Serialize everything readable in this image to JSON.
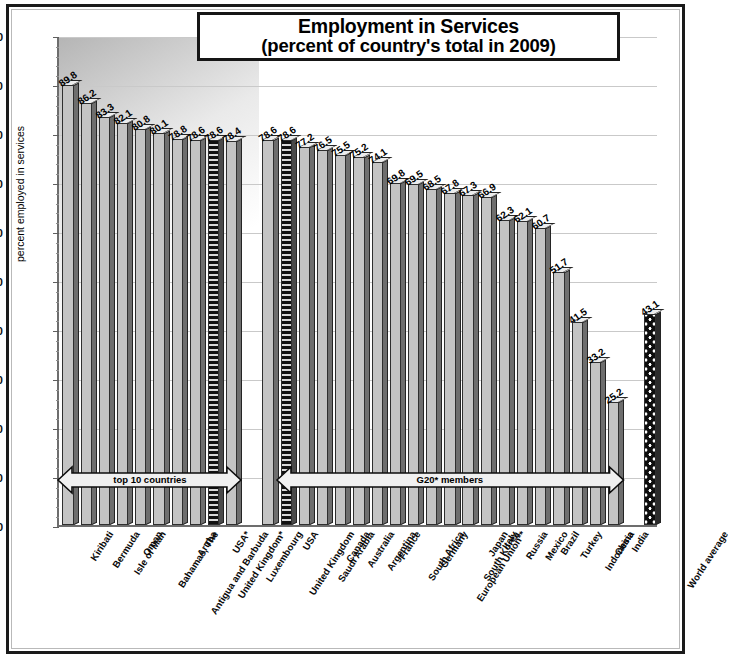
{
  "chart_data": {
    "type": "bar",
    "title": "Employment in Services (percent of country's total in 2009)",
    "title_line1": "Employment in Services",
    "title_line2": "(percent of country's total in 2009)",
    "xlabel": "",
    "ylabel": "percent employed in services",
    "ylim": [
      0,
      100
    ],
    "ytick_step": 10,
    "yticks": [
      "0",
      "10",
      "20",
      "30",
      "40",
      "50",
      "60",
      "70",
      "80",
      "90",
      "100"
    ],
    "grid": true,
    "legend_position": "none",
    "categories": [
      "Kiribati",
      "Bermuda",
      "Isle of Man",
      "Oman",
      "Bahamas, The",
      "Antigua and Barbuda",
      "Aruba",
      "United Kingdom*",
      "USA*",
      "Luxembourg",
      "",
      "United Kingdom",
      "USA",
      "Saudi Arabia",
      "Canada",
      "Australia",
      "Argentina",
      "France",
      "South Africa",
      "Germany",
      "European Union**",
      "South Korea",
      "Japan",
      "Italy",
      "Russia",
      "Mexico",
      "Brazil",
      "Turkey",
      "Indonesia",
      "China",
      "India",
      "",
      "World average"
    ],
    "values": [
      89.8,
      86.2,
      83.3,
      82.1,
      80.8,
      80.1,
      78.8,
      78.6,
      78.6,
      78.4,
      null,
      78.6,
      78.6,
      77.2,
      76.5,
      75.5,
      75.2,
      74.1,
      69.8,
      69.5,
      68.5,
      67.8,
      67.3,
      66.9,
      62.3,
      62.1,
      60.7,
      51.7,
      41.5,
      33.2,
      25.2,
      null,
      43.1
    ],
    "value_labels": [
      "89.8",
      "86.2",
      "83.3",
      "82.1",
      "80.8",
      "80.1",
      "78.8",
      "78.6",
      "78.6",
      "78.4",
      "",
      "78.6",
      "78.6",
      "77.2",
      "76.5",
      "75.5",
      "75.2",
      "74.1",
      "69.8",
      "69.5",
      "68.5",
      "67.8",
      "67.3",
      "66.9",
      "62.3",
      "62.1",
      "60.7",
      "51.7",
      "41.5",
      "33.2",
      "25.2",
      "",
      "43.1"
    ],
    "patterned_indices": [
      8,
      12
    ],
    "world_average_index": 32,
    "annotations": [
      {
        "text": "top 10 countries",
        "from_index": 0,
        "to_index": 9,
        "style": "double-arrow"
      },
      {
        "text": "G20* members",
        "from_index": 12,
        "to_index": 30,
        "style": "double-arrow"
      }
    ]
  },
  "caption": {
    "footnote": ""
  }
}
